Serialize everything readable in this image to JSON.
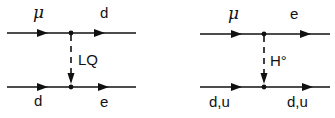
{
  "diagrams": [
    {
      "name": "leptoquark-exchange",
      "top_in": "μ",
      "top_out": "d",
      "bottom_in": "d",
      "bottom_out": "e",
      "mediator": "LQ"
    },
    {
      "name": "neutral-higgs-exchange",
      "top_in": "μ",
      "top_out": "e",
      "bottom_in": "d,u",
      "bottom_out": "d,u",
      "mediator": "H°"
    }
  ],
  "colors": {
    "ink": "#111111",
    "background": "#ffffff"
  }
}
